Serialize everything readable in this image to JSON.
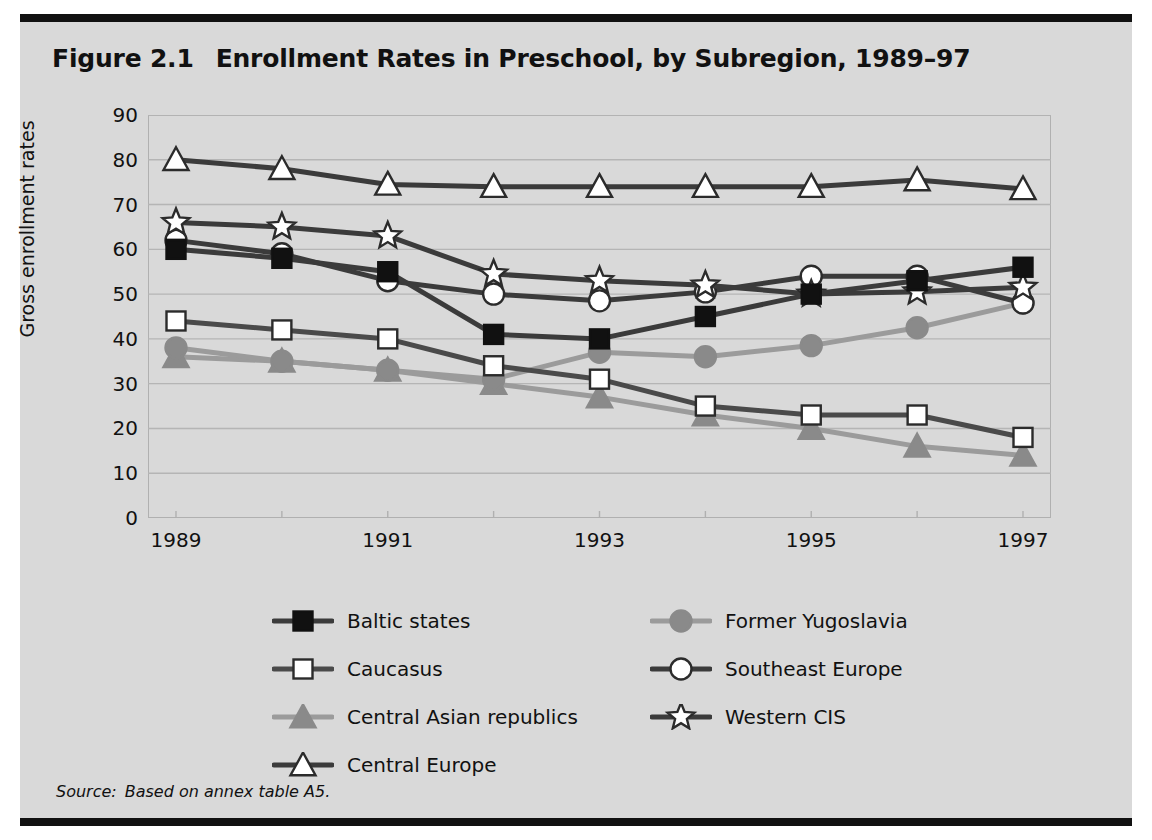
{
  "figure": {
    "number": "Figure 2.1",
    "title": "Enrollment Rates in Preschool, by Subregion, 1989–97",
    "source_label": "Source:",
    "source_text": "Based on annex table A5."
  },
  "colors": {
    "panel_background": "#d9d9d9",
    "rule": "#111111",
    "dark_line": "#3b3b3b",
    "black_line": "#111111",
    "mid_gray": "#8a8a8a",
    "light_gray": "#a8a8a8",
    "marker_fill_white": "#ffffff",
    "gridline": "#b5b5b5"
  },
  "legend": {
    "position": "below-plot",
    "entries": [
      {
        "label": "Baltic states",
        "marker": "filled-square",
        "marker_color": "#111111",
        "line_color": "#3b3b3b",
        "column": 0,
        "row": 0
      },
      {
        "label": "Caucasus",
        "marker": "open-square",
        "marker_color": "#ffffff",
        "line_color": "#4a4a4a",
        "column": 0,
        "row": 1
      },
      {
        "label": "Central Asian republics",
        "marker": "filled-triangle",
        "marker_color": "#8a8a8a",
        "line_color": "#9b9b9b",
        "column": 0,
        "row": 2
      },
      {
        "label": "Central Europe",
        "marker": "open-triangle",
        "marker_color": "#ffffff",
        "line_color": "#3b3b3b",
        "column": 0,
        "row": 3
      },
      {
        "label": "Former Yugoslavia",
        "marker": "filled-circle",
        "marker_color": "#8a8a8a",
        "line_color": "#9b9b9b",
        "column": 1,
        "row": 0
      },
      {
        "label": "Southeast Europe",
        "marker": "open-circle",
        "marker_color": "#ffffff",
        "line_color": "#3b3b3b",
        "column": 1,
        "row": 1
      },
      {
        "label": "Western CIS",
        "marker": "open-star",
        "marker_color": "#ffffff",
        "line_color": "#3b3b3b",
        "column": 1,
        "row": 2
      }
    ]
  },
  "chart_data": {
    "type": "line",
    "title": "Enrollment Rates in Preschool, by Subregion, 1989–97",
    "xlabel": "",
    "ylabel": "Gross enrollment rates",
    "x": [
      1989,
      1990,
      1991,
      1992,
      1993,
      1994,
      1995,
      1996,
      1997
    ],
    "x_tick_labels": [
      "1989",
      "",
      "1991",
      "",
      "1993",
      "",
      "1995",
      "",
      "1997"
    ],
    "x_ticks_shown": [
      "1989",
      "1991",
      "1993",
      "1995",
      "1997"
    ],
    "ylim": [
      0,
      90
    ],
    "y_ticks": [
      0,
      10,
      20,
      30,
      40,
      50,
      60,
      70,
      80,
      90
    ],
    "grid": "horizontal",
    "legend_position": "below",
    "series": [
      {
        "name": "Baltic states",
        "marker": "filled-square",
        "marker_color": "#111111",
        "line_color": "#3b3b3b",
        "values": [
          60,
          58,
          55,
          41,
          40,
          45,
          50,
          53,
          56
        ]
      },
      {
        "name": "Caucasus",
        "marker": "open-square",
        "marker_color": "#ffffff",
        "line_color": "#4a4a4a",
        "values": [
          44,
          42,
          40,
          34,
          31,
          25,
          23,
          23,
          18
        ]
      },
      {
        "name": "Central Asian republics",
        "marker": "filled-triangle",
        "marker_color": "#8a8a8a",
        "line_color": "#9b9b9b",
        "values": [
          36,
          35,
          33,
          30,
          27,
          23,
          20,
          16,
          14
        ]
      },
      {
        "name": "Central Europe",
        "marker": "open-triangle",
        "marker_color": "#ffffff",
        "line_color": "#3b3b3b",
        "values": [
          80,
          78,
          74.5,
          74,
          74,
          74,
          74,
          75.5,
          73.5
        ]
      },
      {
        "name": "Former Yugoslavia",
        "marker": "filled-circle",
        "marker_color": "#8a8a8a",
        "line_color": "#9b9b9b",
        "values": [
          38,
          35,
          33,
          31,
          37,
          36,
          38.5,
          42.5,
          48
        ]
      },
      {
        "name": "Southeast Europe",
        "marker": "open-circle",
        "marker_color": "#ffffff",
        "line_color": "#3b3b3b",
        "values": [
          62,
          59,
          53,
          50,
          48.5,
          50.5,
          54,
          54,
          48
        ]
      },
      {
        "name": "Western CIS",
        "marker": "open-star",
        "marker_color": "#ffffff",
        "line_color": "#3b3b3b",
        "values": [
          66,
          65,
          63,
          54.5,
          53,
          52,
          50,
          50.5,
          51.5
        ]
      }
    ]
  }
}
